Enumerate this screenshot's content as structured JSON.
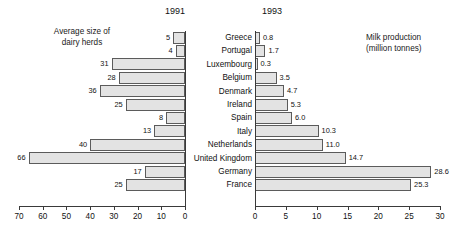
{
  "chart_data": {
    "type": "bar",
    "title": "",
    "layout": "back-to-back horizontal bar pyramid",
    "grid": false,
    "legend": "none",
    "categories": [
      "Greece",
      "Portugal",
      "Luxembourg",
      "Belgium",
      "Denmark",
      "Ireland",
      "Spain",
      "Italy",
      "Netherlands",
      "United Kingdom",
      "Germany",
      "France"
    ],
    "panels": [
      {
        "name": "left",
        "year": "1991",
        "caption": "Average size of\ndairy herds",
        "xlabel": "",
        "ylabel": "",
        "direction": "right-to-left",
        "xlim": [
          0,
          70
        ],
        "ticks": [
          70,
          60,
          50,
          40,
          30,
          20,
          10,
          0
        ],
        "values": [
          5,
          4,
          31,
          28,
          36,
          25,
          8,
          13,
          40,
          66,
          17,
          25
        ],
        "value_labels": [
          "5",
          "4",
          "31",
          "28",
          "36",
          "25",
          "8",
          "13",
          "40",
          "66",
          "17",
          "25"
        ]
      },
      {
        "name": "right",
        "year": "1993",
        "caption": "Milk production\n(million tonnes)",
        "xlabel": "",
        "ylabel": "",
        "direction": "left-to-right",
        "xlim": [
          0,
          30
        ],
        "ticks": [
          0,
          5,
          10,
          15,
          20,
          25,
          30
        ],
        "values": [
          0.8,
          1.7,
          0.3,
          3.5,
          4.7,
          5.3,
          6.0,
          10.3,
          11.0,
          14.7,
          28.6,
          25.3
        ],
        "value_labels": [
          "0.8",
          "1.7",
          "0.3",
          "3.5",
          "4.7",
          "5.3",
          "6.0",
          "10.3",
          "11.0",
          "14.7",
          "28.6",
          "25.3"
        ]
      }
    ],
    "colors": {
      "bar_fill": "#e3e3e3",
      "bar_stroke": "#5b5b5b",
      "axis": "#3a3a3a",
      "text": "#111111",
      "background": "#ffffff"
    }
  }
}
